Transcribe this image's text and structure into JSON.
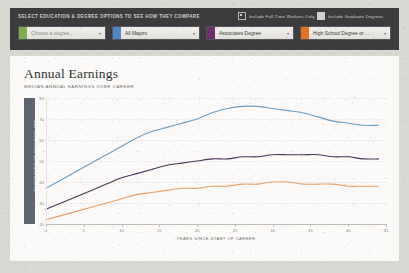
{
  "panel": {
    "caption": "SELECT EDUCATION & DEGREE OPTIONS TO SEE HOW THEY COMPARE",
    "checkboxes": [
      {
        "label": "Include Full-Time Workers Only",
        "checked": true,
        "name": "include-full-time-workers-only"
      },
      {
        "label": "Include Graduate Degrees",
        "checked": true,
        "name": "include-graduate-degrees"
      }
    ],
    "selects": [
      {
        "value": "Choose a degree...",
        "placeholder": true,
        "swatch": "#7fae4f",
        "name": "degree-select-1"
      },
      {
        "value": "All Majors",
        "placeholder": false,
        "swatch": "#4f86c6",
        "name": "degree-select-2"
      },
      {
        "value": "Associates Degree",
        "placeholder": false,
        "swatch": "#6b2f6b",
        "name": "degree-select-3"
      },
      {
        "value": "High School Degree or ...",
        "placeholder": false,
        "swatch": "#e8701a",
        "name": "degree-select-4"
      }
    ],
    "caret": "▾"
  },
  "card": {
    "title": "Annual Earnings",
    "subtitle": "MEDIAN ANNUAL EARNINGS OVER CAREER"
  },
  "chart_data": {
    "type": "line",
    "title": "Annual Earnings",
    "subtitle": "MEDIAN ANNUAL EARNINGS OVER CAREER",
    "xlabel": "YEARS SINCE START OF CAREER",
    "ylabel": "THOUSANDS OF 2014 DOLLARS",
    "xlim": [
      0,
      45
    ],
    "ylim": [
      20,
      80
    ],
    "xticks": [
      0,
      5,
      10,
      15,
      20,
      25,
      30,
      35,
      40,
      45
    ],
    "yticks": [
      20,
      30,
      40,
      50,
      60,
      70,
      80
    ],
    "grid": true,
    "legend": "none",
    "x": [
      0,
      2,
      4,
      6,
      8,
      10,
      12,
      14,
      16,
      18,
      20,
      22,
      24,
      26,
      28,
      30,
      32,
      34,
      36,
      38,
      40,
      42,
      44
    ],
    "series": [
      {
        "name": "All Majors",
        "color": "#6f9dc0",
        "values": [
          37,
          41,
          45,
          49,
          53,
          57,
          61,
          64,
          66,
          68,
          70,
          73,
          75,
          76,
          76,
          75,
          74,
          73,
          71,
          69,
          68,
          67,
          67
        ]
      },
      {
        "name": "Associates Degree",
        "color": "#4a3457",
        "values": [
          27,
          30,
          33,
          36,
          39,
          42,
          44,
          46,
          48,
          49,
          50,
          51,
          51,
          52,
          52,
          53,
          53,
          53,
          53,
          52,
          52,
          51,
          51
        ]
      },
      {
        "name": "High School Degree or ...",
        "color": "#e8a06a",
        "values": [
          22,
          24,
          26,
          28,
          30,
          32,
          34,
          35,
          36,
          37,
          37,
          38,
          38,
          39,
          39,
          40,
          40,
          39,
          39,
          39,
          38,
          38,
          38
        ]
      }
    ]
  }
}
